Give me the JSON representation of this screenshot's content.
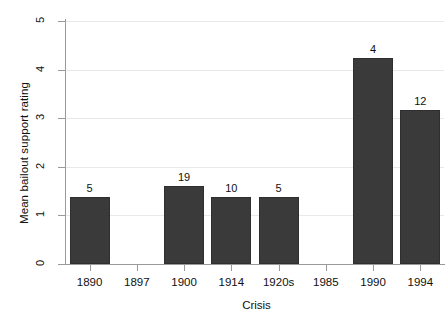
{
  "chart_data": {
    "type": "bar",
    "title": "",
    "xlabel": "Crisis",
    "ylabel": "Mean bailout support rating",
    "categories": [
      "1890",
      "1897",
      "1900",
      "1914",
      "1920s",
      "1985",
      "1990",
      "1994"
    ],
    "values": [
      1.38,
      null,
      1.6,
      1.38,
      1.38,
      null,
      4.24,
      3.17
    ],
    "bar_labels": [
      "5",
      "",
      "19",
      "10",
      "5",
      "",
      "4",
      "12"
    ],
    "bar_label_meaning": "number of observations",
    "ylim": [
      0,
      5
    ],
    "yticks": [
      "0",
      "1",
      "2",
      "3",
      "4",
      "5"
    ],
    "ytick_values": [
      0,
      1,
      2,
      3,
      4,
      5
    ],
    "grid": true,
    "grid_axis": "y",
    "legend": null,
    "bar_color": "#3a3a3a",
    "grid_color": "#e8e8e8",
    "axis_color": "#9a9a9a",
    "background": "#ffffff"
  }
}
